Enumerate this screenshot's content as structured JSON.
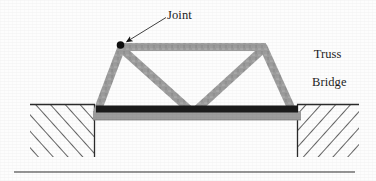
{
  "figure": {
    "type": "line-drawing",
    "background_color": "#fdfdfd"
  },
  "annotations": {
    "joint_label": "Joint",
    "caption_line_1": "Truss",
    "caption_line_2": "Bridge"
  },
  "colors": {
    "member_gray": "#9c9c9c",
    "member_gray_dark": "#8a8a8a",
    "deck_dark": "#1b1b1b",
    "ink_black": "#1d1d1d",
    "hatch_gray": "#3a3a3a",
    "ground_outline": "#2b2b2b"
  },
  "geometry": {
    "joint_marker": {
      "cx": 120,
      "cy": 45,
      "r": 3.6
    },
    "leader_arrow": {
      "x1": 165,
      "y1": 18,
      "x2": 124,
      "y2": 43
    },
    "top_chord": {
      "x1": 121,
      "y1": 47,
      "x2": 264,
      "y2": 47
    },
    "left_diagonal": {
      "x1": 121,
      "y1": 47,
      "x2": 96,
      "y2": 110
    },
    "right_diagonal": {
      "x1": 264,
      "y1": 47,
      "x2": 294,
      "y2": 110
    },
    "web_left": {
      "x1": 121,
      "y1": 49,
      "x2": 193,
      "y2": 110
    },
    "web_right": {
      "x1": 264,
      "y1": 49,
      "x2": 193,
      "y2": 110
    },
    "deck_dark_bar": {
      "x": 95,
      "y": 106,
      "width": 204,
      "height": 7
    },
    "deck_gray_bar": {
      "x": 93,
      "y": 112,
      "width": 208,
      "height": 8
    },
    "ground_left": {
      "x": 30,
      "y": 104,
      "width": 65,
      "height": 53
    },
    "ground_right": {
      "x": 297,
      "y": 104,
      "width": 62,
      "height": 53
    },
    "baseline_rule": {
      "x1": 14,
      "y1": 172,
      "x2": 355,
      "y2": 172
    }
  }
}
